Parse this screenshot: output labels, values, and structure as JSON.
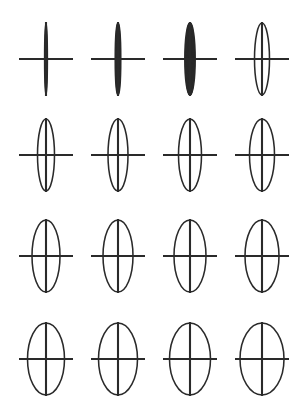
{
  "figure": {
    "title": "Grid of ellipses with crosshair axes",
    "background_color": "#ffffff",
    "stroke_color": "#2a2a2a",
    "rows": 4,
    "columns": 4,
    "width": 301,
    "height": 411
  },
  "chart_data": {
    "type": "scatter",
    "title": "Grid of ellipses with crosshair axes",
    "subtitle": "",
    "xlabel": "",
    "ylabel": "",
    "xlim": [
      0,
      301
    ],
    "ylim": [
      0,
      411
    ],
    "grid": false,
    "legend_position": "none",
    "tick_labels_x": [],
    "tick_labels_y": [],
    "annotations": [],
    "column_centers_px": [
      46,
      118,
      190,
      262
    ],
    "row_centers_px": [
      59,
      155,
      256,
      359
    ],
    "horizontal_axis_half_length_px": 27,
    "vertical_axis_half_length_px": 37,
    "series": [
      {
        "name": "ellipses",
        "values": [
          {
            "id": "r1c1",
            "row": 1,
            "col": 1,
            "cx": 46,
            "cy": 59,
            "rx": 1.2,
            "ry": 36,
            "aspect_ratio": 0.033
          },
          {
            "id": "r1c2",
            "row": 1,
            "col": 2,
            "cx": 118,
            "cy": 59,
            "rx": 2.6,
            "ry": 36,
            "aspect_ratio": 0.072
          },
          {
            "id": "r1c3",
            "row": 1,
            "col": 3,
            "cx": 190,
            "cy": 59,
            "rx": 5.0,
            "ry": 36,
            "aspect_ratio": 0.139
          },
          {
            "id": "r1c4",
            "row": 1,
            "col": 4,
            "cx": 262,
            "cy": 59,
            "rx": 7.5,
            "ry": 36,
            "aspect_ratio": 0.208
          },
          {
            "id": "r2c1",
            "row": 2,
            "col": 1,
            "cx": 46,
            "cy": 155,
            "rx": 8.5,
            "ry": 36,
            "aspect_ratio": 0.236
          },
          {
            "id": "r2c2",
            "row": 2,
            "col": 2,
            "cx": 118,
            "cy": 155,
            "rx": 10.0,
            "ry": 36,
            "aspect_ratio": 0.278
          },
          {
            "id": "r2c3",
            "row": 2,
            "col": 3,
            "cx": 190,
            "cy": 155,
            "rx": 11.5,
            "ry": 36,
            "aspect_ratio": 0.319
          },
          {
            "id": "r2c4",
            "row": 2,
            "col": 4,
            "cx": 262,
            "cy": 155,
            "rx": 12.5,
            "ry": 36,
            "aspect_ratio": 0.347
          },
          {
            "id": "r3c1",
            "row": 3,
            "col": 1,
            "cx": 46,
            "cy": 256,
            "rx": 14.0,
            "ry": 36,
            "aspect_ratio": 0.389
          },
          {
            "id": "r3c2",
            "row": 3,
            "col": 2,
            "cx": 118,
            "cy": 256,
            "rx": 15.0,
            "ry": 36,
            "aspect_ratio": 0.417
          },
          {
            "id": "r3c3",
            "row": 3,
            "col": 3,
            "cx": 190,
            "cy": 256,
            "rx": 16.0,
            "ry": 36,
            "aspect_ratio": 0.444
          },
          {
            "id": "r3c4",
            "row": 3,
            "col": 4,
            "cx": 262,
            "cy": 256,
            "rx": 17.0,
            "ry": 36,
            "aspect_ratio": 0.472
          },
          {
            "id": "r4c1",
            "row": 4,
            "col": 1,
            "cx": 46,
            "cy": 359,
            "rx": 18.5,
            "ry": 36,
            "aspect_ratio": 0.514
          },
          {
            "id": "r4c2",
            "row": 4,
            "col": 2,
            "cx": 118,
            "cy": 359,
            "rx": 19.5,
            "ry": 36,
            "aspect_ratio": 0.542
          },
          {
            "id": "r4c3",
            "row": 4,
            "col": 3,
            "cx": 190,
            "cy": 359,
            "rx": 20.5,
            "ry": 36,
            "aspect_ratio": 0.569
          },
          {
            "id": "r4c4",
            "row": 4,
            "col": 4,
            "cx": 262,
            "cy": 359,
            "rx": 22.0,
            "ry": 36,
            "aspect_ratio": 0.611
          }
        ]
      }
    ]
  }
}
